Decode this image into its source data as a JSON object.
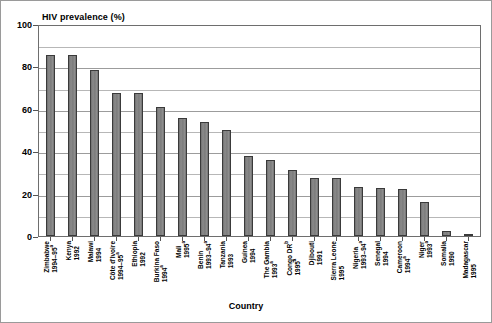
{
  "chart_data": {
    "type": "bar",
    "title": "",
    "ylabel": "HIV prevalence (%)",
    "xlabel": "Country",
    "ylim": [
      0,
      100
    ],
    "yticks": [
      0,
      20,
      40,
      60,
      80,
      100
    ],
    "minor_gridlines": [
      10,
      30,
      50,
      70,
      90
    ],
    "grid": true,
    "legend": "none",
    "bar_color": "#7c7c7c",
    "bar_edge_color": "#3a3a3a",
    "categories": [
      "Zimbabwe 1994–95",
      "Kenya 1992",
      "Malawi 1994",
      "Côte d'Ivoire 1994–95",
      "Ethiopia 1992",
      "Burkina Faso 1994",
      "Mali 1995",
      "Benin 1993–94",
      "Tanzania 1993",
      "Guinea 1994",
      "The Gambia 1993",
      "Congo DR 1995",
      "Djibouti 1991",
      "Sierra Leone 1995",
      "Nigeria 1993–94",
      "Senegal 1994",
      "Cameroon 1994",
      "Niger 1993",
      "Somalia 1990",
      "Madagascar 1995"
    ],
    "values": [
      85.5,
      85.4,
      78.2,
      67.5,
      67.4,
      60.7,
      55.6,
      53.9,
      50.0,
      37.8,
      35.9,
      31.2,
      27.5,
      27.3,
      23.2,
      22.8,
      22.2,
      16.1,
      2.5,
      0.6
    ]
  },
  "axes": {
    "y_title": "HIV prevalence (%)",
    "x_title": "Country",
    "y_tick_labels": [
      "100",
      "80",
      "60",
      "40",
      "20",
      "0"
    ]
  },
  "x_categories": [
    {
      "name": "Zimbabwe",
      "years": "1994–95",
      "note": "a"
    },
    {
      "name": "Kenya",
      "years": "1992",
      "note": ""
    },
    {
      "name": "Malawi",
      "years": "1994",
      "note": ""
    },
    {
      "name": "Côte d'Ivoire",
      "years": "1994–95",
      "note": "a"
    },
    {
      "name": "Ethiopia",
      "years": "1992",
      "note": ""
    },
    {
      "name": "Burkina Faso",
      "years": "1994",
      "note": "a"
    },
    {
      "name": "Mali",
      "years": "1995",
      "note": "a"
    },
    {
      "name": "Benin",
      "years": "1993–94",
      "note": "a"
    },
    {
      "name": "Tanzania",
      "years": "1993",
      "note": ""
    },
    {
      "name": "Guinea",
      "years": "1994",
      "note": ""
    },
    {
      "name": "The Gambia",
      "years": "1993",
      "note": "a"
    },
    {
      "name": "Congo DR",
      "years": "1995",
      "note": "a",
      "name_note": "b"
    },
    {
      "name": "Djibouti",
      "years": "1991",
      "note": ""
    },
    {
      "name": "Sierra Leone",
      "years": "1995",
      "note": ""
    },
    {
      "name": "Nigeria",
      "years": "1993–94",
      "note": "a"
    },
    {
      "name": "Senegal",
      "years": "1994",
      "note": ""
    },
    {
      "name": "Cameroon",
      "years": "1994",
      "note": "a"
    },
    {
      "name": "Niger",
      "years": "1993",
      "note": "a"
    },
    {
      "name": "Somalia",
      "years": "1990",
      "note": ""
    },
    {
      "name": "Madagascar",
      "years": "1995",
      "note": ""
    }
  ]
}
